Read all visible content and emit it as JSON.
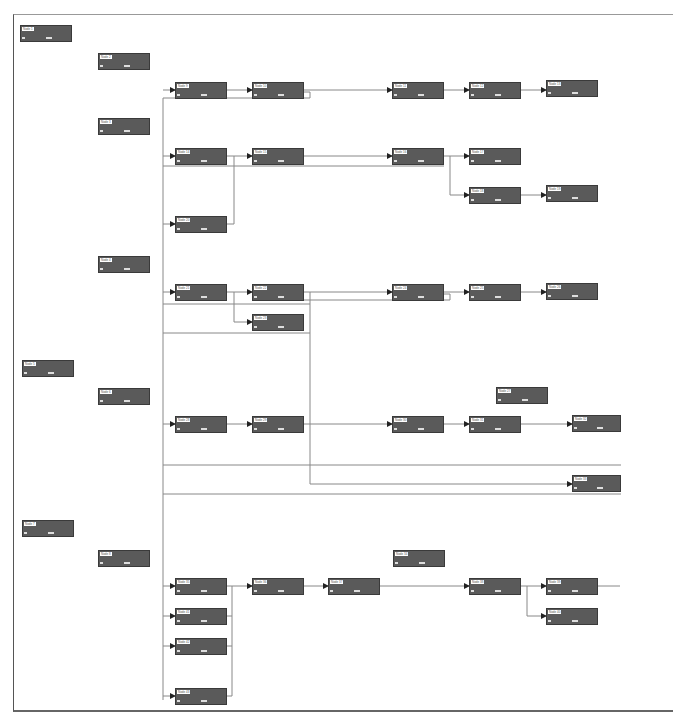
{
  "diagram": {
    "type": "node-link flow diagram",
    "note": "Node label text is present in the image but is illegible at the available resolution; placeholders are used.",
    "node_fill": "#5a5a5a",
    "edge_color": "#777777",
    "nodes": [
      {
        "id": "n1",
        "label": "Node 1",
        "x": 20,
        "y": 25,
        "w": 52
      },
      {
        "id": "n2",
        "label": "Node 2",
        "x": 98,
        "y": 53,
        "w": 52
      },
      {
        "id": "n3",
        "label": "Node 3",
        "x": 98,
        "y": 118,
        "w": 52
      },
      {
        "id": "n4",
        "label": "Node 4",
        "x": 98,
        "y": 256,
        "w": 52
      },
      {
        "id": "n5",
        "label": "Node 5",
        "x": 22,
        "y": 360,
        "w": 52
      },
      {
        "id": "n6",
        "label": "Node 6",
        "x": 98,
        "y": 388,
        "w": 52
      },
      {
        "id": "n7",
        "label": "Node 7",
        "x": 22,
        "y": 520,
        "w": 52
      },
      {
        "id": "n8",
        "label": "Node 8",
        "x": 98,
        "y": 550,
        "w": 52
      },
      {
        "id": "n9",
        "label": "Node 9",
        "x": 175,
        "y": 82,
        "w": 52
      },
      {
        "id": "n10",
        "label": "Node 10",
        "x": 252,
        "y": 82,
        "w": 52
      },
      {
        "id": "n11",
        "label": "Node 11",
        "x": 392,
        "y": 82,
        "w": 52
      },
      {
        "id": "n12",
        "label": "Node 12",
        "x": 469,
        "y": 82,
        "w": 52
      },
      {
        "id": "n13",
        "label": "Node 13",
        "x": 546,
        "y": 80,
        "w": 52
      },
      {
        "id": "n14",
        "label": "Node 14",
        "x": 175,
        "y": 148,
        "w": 52
      },
      {
        "id": "n15",
        "label": "Node 15",
        "x": 252,
        "y": 148,
        "w": 52
      },
      {
        "id": "n16",
        "label": "Node 16",
        "x": 392,
        "y": 148,
        "w": 52
      },
      {
        "id": "n17",
        "label": "Node 17",
        "x": 469,
        "y": 148,
        "w": 52
      },
      {
        "id": "n18",
        "label": "Node 18",
        "x": 469,
        "y": 187,
        "w": 52
      },
      {
        "id": "n19",
        "label": "Node 19",
        "x": 546,
        "y": 185,
        "w": 52
      },
      {
        "id": "n20",
        "label": "Node 20",
        "x": 175,
        "y": 216,
        "w": 52
      },
      {
        "id": "n21",
        "label": "Node 21",
        "x": 175,
        "y": 284,
        "w": 52
      },
      {
        "id": "n22",
        "label": "Node 22",
        "x": 252,
        "y": 284,
        "w": 52
      },
      {
        "id": "n23",
        "label": "Node 23",
        "x": 252,
        "y": 314,
        "w": 52
      },
      {
        "id": "n24",
        "label": "Node 24",
        "x": 392,
        "y": 284,
        "w": 52
      },
      {
        "id": "n25",
        "label": "Node 25",
        "x": 469,
        "y": 284,
        "w": 52
      },
      {
        "id": "n26",
        "label": "Node 26",
        "x": 546,
        "y": 283,
        "w": 52
      },
      {
        "id": "n27",
        "label": "Node 27",
        "x": 496,
        "y": 387,
        "w": 52
      },
      {
        "id": "n28",
        "label": "Node 28",
        "x": 175,
        "y": 416,
        "w": 52
      },
      {
        "id": "n29",
        "label": "Node 29",
        "x": 252,
        "y": 416,
        "w": 52
      },
      {
        "id": "n30",
        "label": "Node 30",
        "x": 392,
        "y": 416,
        "w": 52
      },
      {
        "id": "n31",
        "label": "Node 31",
        "x": 469,
        "y": 416,
        "w": 52
      },
      {
        "id": "n32",
        "label": "Node 32",
        "x": 572,
        "y": 415,
        "w": 49
      },
      {
        "id": "n33",
        "label": "Node 33",
        "x": 572,
        "y": 475,
        "w": 49
      },
      {
        "id": "n34",
        "label": "Node 34",
        "x": 393,
        "y": 550,
        "w": 52
      },
      {
        "id": "n35",
        "label": "Node 35",
        "x": 175,
        "y": 578,
        "w": 52
      },
      {
        "id": "n36",
        "label": "Node 36",
        "x": 252,
        "y": 578,
        "w": 52
      },
      {
        "id": "n37",
        "label": "Node 37",
        "x": 328,
        "y": 578,
        "w": 52
      },
      {
        "id": "n38",
        "label": "Node 38",
        "x": 469,
        "y": 578,
        "w": 52
      },
      {
        "id": "n39",
        "label": "Node 39",
        "x": 546,
        "y": 578,
        "w": 52
      },
      {
        "id": "n40",
        "label": "Node 40",
        "x": 546,
        "y": 608,
        "w": 52
      },
      {
        "id": "n41",
        "label": "Node 41",
        "x": 175,
        "y": 608,
        "w": 52
      },
      {
        "id": "n42",
        "label": "Node 42",
        "x": 175,
        "y": 638,
        "w": 52
      },
      {
        "id": "n43",
        "label": "Node 43",
        "x": 175,
        "y": 688,
        "w": 52
      }
    ]
  }
}
